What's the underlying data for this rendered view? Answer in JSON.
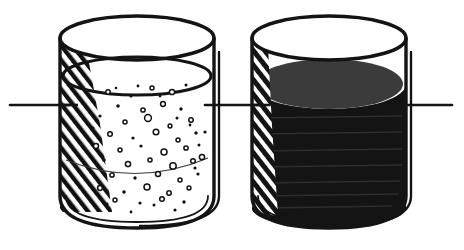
{
  "figure": {
    "description": "Hand-drawn line illustration of two cylindrical beakers side by side, each cut by a common horizontal reference line at the same height. The left beaker holds a clear liquid full of small bubbles; the right beaker holds an opaque dark liquid. Both beakers are cross-hatched along their left-hand walls.",
    "style": "pen-and-ink line drawing",
    "canvas": {
      "width": 464,
      "height": 250
    },
    "background_color": "#ffffff",
    "ink_color": "#111111"
  },
  "reference_line": {
    "name": "liquid-level-reference-line",
    "label": "",
    "y": 105,
    "x_start": 10,
    "x_end": 452,
    "stroke_color": "#141414",
    "stroke_width": 2.6,
    "segments": [
      {
        "x_start": 10,
        "x_end": 70
      },
      {
        "x_start": 205,
        "x_end": 262
      },
      {
        "x_start": 398,
        "x_end": 452
      }
    ]
  },
  "containers": [
    {
      "id": "left-beaker",
      "name": "clear-liquid-beaker",
      "label": "",
      "position": "left",
      "center_x": 137,
      "rim_top_y": 38,
      "rim_rx": 77,
      "rim_ry": 22,
      "base_y": 208,
      "base_ry": 20,
      "wall_left_x": 60,
      "wall_right_x": 214,
      "liquid": {
        "name": "clear-liquid",
        "type": "clear",
        "fill_color": "#ffffff",
        "surface_y": 76,
        "surface_rx": 74,
        "surface_ry": 19,
        "has_bubbles": true,
        "bubble_count": 58,
        "interior_arc_y": 162
      },
      "hatching": {
        "name": "left-wall-hatching",
        "direction": "diagonal-up-right",
        "spacing": 9,
        "stroke_width": 4.2,
        "color": "#111111",
        "region": "left quarter of cylinder wall"
      }
    },
    {
      "id": "right-beaker",
      "name": "dark-liquid-beaker",
      "label": "",
      "position": "right",
      "center_x": 329,
      "rim_top_y": 38,
      "rim_rx": 77,
      "rim_ry": 22,
      "base_y": 208,
      "base_ry": 20,
      "wall_left_x": 252,
      "wall_right_x": 406,
      "liquid": {
        "name": "dark-liquid",
        "type": "opaque-dark",
        "fill_color": "#141414",
        "surface_color": "#3b3b3b",
        "surface_y": 84,
        "surface_rx": 74,
        "surface_ry": 25,
        "has_bubbles": false,
        "streak_count": 7,
        "streak_color": "#2e2e2e"
      },
      "hatching": {
        "name": "left-wall-hatching",
        "direction": "diagonal-up-right",
        "spacing": 9,
        "stroke_width": 4.2,
        "color": "#ffffff",
        "region": "left edge of cylinder wall, drawn in reverse over the dark fill"
      }
    }
  ],
  "bubbles": [
    {
      "cx": 108,
      "cy": 92,
      "r": 2.2,
      "filled": false
    },
    {
      "cx": 131,
      "cy": 96,
      "r": 1.6,
      "filled": true
    },
    {
      "cx": 152,
      "cy": 88,
      "r": 2.0,
      "filled": false
    },
    {
      "cx": 172,
      "cy": 92,
      "r": 2.6,
      "filled": false
    },
    {
      "cx": 186,
      "cy": 85,
      "r": 1.5,
      "filled": true
    },
    {
      "cx": 118,
      "cy": 106,
      "r": 1.8,
      "filled": true
    },
    {
      "cx": 143,
      "cy": 110,
      "r": 2.1,
      "filled": false
    },
    {
      "cx": 163,
      "cy": 104,
      "r": 2.4,
      "filled": false
    },
    {
      "cx": 181,
      "cy": 109,
      "r": 1.7,
      "filled": true
    },
    {
      "cx": 100,
      "cy": 116,
      "r": 1.6,
      "filled": true
    },
    {
      "cx": 125,
      "cy": 122,
      "r": 2.0,
      "filled": false
    },
    {
      "cx": 148,
      "cy": 118,
      "r": 3.4,
      "filled": false
    },
    {
      "cx": 170,
      "cy": 126,
      "r": 1.9,
      "filled": false
    },
    {
      "cx": 191,
      "cy": 120,
      "r": 2.2,
      "filled": false
    },
    {
      "cx": 110,
      "cy": 134,
      "r": 2.3,
      "filled": false
    },
    {
      "cx": 133,
      "cy": 138,
      "r": 1.6,
      "filled": true
    },
    {
      "cx": 156,
      "cy": 132,
      "r": 2.8,
      "filled": false
    },
    {
      "cx": 178,
      "cy": 140,
      "r": 2.0,
      "filled": false
    },
    {
      "cx": 196,
      "cy": 133,
      "r": 1.7,
      "filled": true
    },
    {
      "cx": 96,
      "cy": 146,
      "r": 2.5,
      "filled": false
    },
    {
      "cx": 120,
      "cy": 150,
      "r": 2.0,
      "filled": false
    },
    {
      "cx": 141,
      "cy": 146,
      "r": 1.6,
      "filled": true
    },
    {
      "cx": 164,
      "cy": 152,
      "r": 3.0,
      "filled": false
    },
    {
      "cx": 186,
      "cy": 148,
      "r": 2.1,
      "filled": false
    },
    {
      "cx": 104,
      "cy": 160,
      "r": 1.8,
      "filled": true
    },
    {
      "cx": 128,
      "cy": 164,
      "r": 2.6,
      "filled": false
    },
    {
      "cx": 150,
      "cy": 160,
      "r": 2.0,
      "filled": false
    },
    {
      "cx": 173,
      "cy": 166,
      "r": 3.2,
      "filled": false
    },
    {
      "cx": 193,
      "cy": 161,
      "r": 2.3,
      "filled": false
    },
    {
      "cx": 112,
      "cy": 175,
      "r": 2.1,
      "filled": false
    },
    {
      "cx": 135,
      "cy": 178,
      "r": 1.7,
      "filled": true
    },
    {
      "cx": 158,
      "cy": 174,
      "r": 2.5,
      "filled": false
    },
    {
      "cx": 180,
      "cy": 180,
      "r": 2.0,
      "filled": false
    },
    {
      "cx": 198,
      "cy": 174,
      "r": 1.6,
      "filled": true
    },
    {
      "cx": 100,
      "cy": 188,
      "r": 2.4,
      "filled": false
    },
    {
      "cx": 124,
      "cy": 192,
      "r": 1.8,
      "filled": true
    },
    {
      "cx": 147,
      "cy": 187,
      "r": 3.0,
      "filled": false
    },
    {
      "cx": 169,
      "cy": 193,
      "r": 2.2,
      "filled": false
    },
    {
      "cx": 189,
      "cy": 188,
      "r": 1.9,
      "filled": false
    },
    {
      "cx": 115,
      "cy": 200,
      "r": 2.0,
      "filled": false
    },
    {
      "cx": 140,
      "cy": 203,
      "r": 1.6,
      "filled": true
    },
    {
      "cx": 162,
      "cy": 199,
      "r": 2.3,
      "filled": false
    },
    {
      "cx": 184,
      "cy": 202,
      "r": 1.7,
      "filled": true
    },
    {
      "cx": 199,
      "cy": 145,
      "r": 1.5,
      "filled": true
    },
    {
      "cx": 202,
      "cy": 157,
      "r": 2.6,
      "filled": false
    },
    {
      "cx": 195,
      "cy": 168,
      "r": 1.6,
      "filled": true
    },
    {
      "cx": 93,
      "cy": 128,
      "r": 1.5,
      "filled": true
    },
    {
      "cx": 91,
      "cy": 172,
      "r": 1.8,
      "filled": true
    },
    {
      "cx": 205,
      "cy": 132,
      "r": 1.6,
      "filled": true
    },
    {
      "cx": 160,
      "cy": 96,
      "r": 1.4,
      "filled": true
    },
    {
      "cx": 138,
      "cy": 86,
      "r": 1.4,
      "filled": true
    },
    {
      "cx": 116,
      "cy": 88,
      "r": 1.3,
      "filled": true
    },
    {
      "cx": 177,
      "cy": 118,
      "r": 1.5,
      "filled": true
    },
    {
      "cx": 154,
      "cy": 205,
      "r": 1.5,
      "filled": true
    },
    {
      "cx": 131,
      "cy": 212,
      "r": 1.4,
      "filled": true
    },
    {
      "cx": 175,
      "cy": 210,
      "r": 1.6,
      "filled": true
    },
    {
      "cx": 107,
      "cy": 204,
      "r": 1.5,
      "filled": true
    },
    {
      "cx": 190,
      "cy": 125,
      "r": 1.4,
      "filled": true
    }
  ]
}
